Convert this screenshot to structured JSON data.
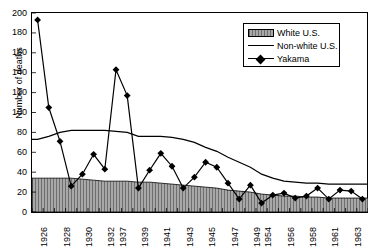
{
  "chart_data": {
    "type": "line",
    "title": "",
    "xlabel": "",
    "ylabel": "Number of deaths",
    "ylim": [
      0,
      200
    ],
    "ytick_step": 20,
    "ytick_labels": [
      "200",
      "180",
      "160",
      "140",
      "120",
      "100",
      "80",
      "60",
      "40",
      "20",
      "0"
    ],
    "grid": false,
    "legend_position": "top-right",
    "categories": [
      "1926",
      "1927",
      "1928",
      "1929",
      "1930",
      "1931",
      "1932",
      "1937",
      "1938",
      "1939",
      "1940",
      "1941",
      "1942",
      "1943",
      "1944",
      "1945",
      "1946",
      "1947",
      "1948",
      "1949",
      "1954",
      "1955",
      "1956",
      "1957",
      "1958",
      "1959",
      "1961",
      "1962",
      "1963",
      "1964"
    ],
    "xtick_labels_shown": [
      "1926",
      "1928",
      "1930",
      "1932",
      "1937",
      "1939",
      "1941",
      "1943",
      "1945",
      "1947",
      "1949",
      "1954",
      "1956",
      "1958",
      "1961",
      "1963"
    ],
    "series": [
      {
        "name": "White U.S.",
        "style": "area-hatched",
        "color": "#a8a8a8",
        "values": [
          34,
          34,
          34,
          34,
          33,
          32,
          31,
          31,
          31,
          30,
          30,
          29,
          28,
          27,
          26,
          25,
          24,
          22,
          21,
          20,
          18,
          17,
          16,
          16,
          15,
          15,
          14,
          14,
          14,
          14
        ]
      },
      {
        "name": "Non-white U.S.",
        "style": "line",
        "color": "#000000",
        "values": [
          73,
          76,
          80,
          82,
          82,
          82,
          82,
          81,
          80,
          76,
          76,
          76,
          75,
          73,
          70,
          65,
          61,
          55,
          50,
          45,
          38,
          34,
          31,
          30,
          29,
          29,
          28,
          28,
          28,
          28
        ]
      },
      {
        "name": "Yakama",
        "style": "line-marker-diamond",
        "color": "#000000",
        "values": [
          193,
          105,
          71,
          26,
          38,
          58,
          43,
          143,
          117,
          24,
          42,
          59,
          46,
          24,
          35,
          50,
          45,
          29,
          13,
          27,
          9,
          17,
          19,
          14,
          16,
          24,
          13,
          22,
          21,
          13
        ]
      }
    ]
  },
  "legend": {
    "items": [
      {
        "label": "White U.S.",
        "marker": "hatched-swatch"
      },
      {
        "label": "Non-white U.S.",
        "marker": "line"
      },
      {
        "label": "Yakama",
        "marker": "line-diamond"
      }
    ]
  }
}
